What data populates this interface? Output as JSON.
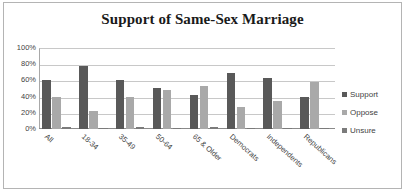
{
  "chart_data": {
    "type": "bar",
    "title": "Support of Same-Sex Marriage",
    "xlabel": "",
    "ylabel": "",
    "ylim": [
      0,
      100
    ],
    "yticks": [
      "0%",
      "20%",
      "40%",
      "60%",
      "80%",
      "100%"
    ],
    "ytick_values": [
      0,
      20,
      40,
      60,
      80,
      100
    ],
    "grid": true,
    "legend_position": "right",
    "categories": [
      "All",
      "18-34",
      "35-49",
      "50-64",
      "65 & Older",
      "Democrats",
      "Independents",
      "Republicans"
    ],
    "series": [
      {
        "name": "Support",
        "color": "#595959",
        "values": [
          60,
          78,
          60,
          51,
          42,
          69,
          63,
          39
        ]
      },
      {
        "name": "Oppose",
        "color": "#a9a9a9",
        "values": [
          40,
          22,
          40,
          48,
          53,
          27,
          34,
          58
        ]
      },
      {
        "name": "Unsure",
        "color": "#7b7b7b",
        "values": [
          2,
          1,
          2,
          1,
          3,
          1,
          1,
          1
        ]
      }
    ]
  },
  "legend": {
    "items": [
      {
        "label": "Support"
      },
      {
        "label": "Oppose"
      },
      {
        "label": "Unsure"
      }
    ]
  }
}
